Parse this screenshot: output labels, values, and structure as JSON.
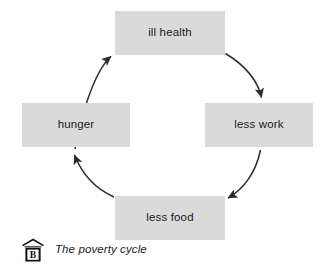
{
  "figure": {
    "caption": "The poverty cycle",
    "caption_icon": "house-label-b-icon",
    "caption_icon_letter": "B",
    "background_color": "#ffffff"
  },
  "diagram": {
    "type": "cycle",
    "node_fill_color": "#dadadb",
    "node_text_color": "#1b1b1b",
    "arrow_color": "#2b2b2b",
    "nodes": [
      {
        "id": "ill-health",
        "label": "ill health",
        "position": "top"
      },
      {
        "id": "less-work",
        "label": "less work",
        "position": "right"
      },
      {
        "id": "less-food",
        "label": "less food",
        "position": "bottom"
      },
      {
        "id": "hunger",
        "label": "hunger",
        "position": "left"
      }
    ],
    "arrows": [
      {
        "id": "arrow-ill-health-to-less-work",
        "from": "ill health",
        "to": "less work",
        "direction": "clockwise"
      },
      {
        "id": "arrow-less-work-to-less-food",
        "from": "less work",
        "to": "less food",
        "direction": "clockwise"
      },
      {
        "id": "arrow-less-food-to-hunger",
        "from": "less food",
        "to": "hunger",
        "direction": "clockwise"
      },
      {
        "id": "arrow-hunger-to-ill-health",
        "from": "hunger",
        "to": "ill health",
        "direction": "clockwise"
      }
    ]
  }
}
